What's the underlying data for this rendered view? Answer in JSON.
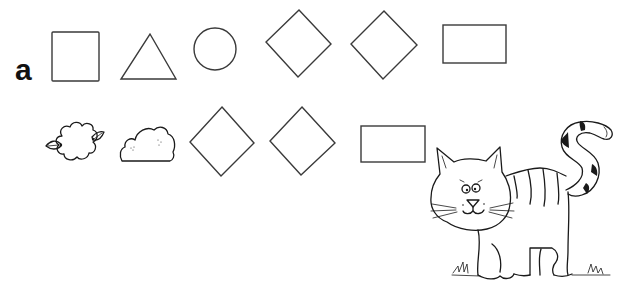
{
  "worksheet": {
    "exercise_label": "a",
    "row1": {
      "shapes": [
        {
          "type": "square",
          "name": "square"
        },
        {
          "type": "triangle",
          "name": "triangle"
        },
        {
          "type": "circle",
          "name": "circle"
        },
        {
          "type": "diamond",
          "name": "diamond"
        },
        {
          "type": "diamond",
          "name": "diamond"
        },
        {
          "type": "rectangle",
          "name": "rectangle"
        }
      ]
    },
    "row2": {
      "shapes": [
        {
          "type": "flower",
          "name": "flower"
        },
        {
          "type": "cloud",
          "name": "cloud"
        },
        {
          "type": "diamond",
          "name": "diamond"
        },
        {
          "type": "diamond",
          "name": "diamond"
        },
        {
          "type": "rectangle",
          "name": "rectangle"
        }
      ]
    },
    "illustration": {
      "subject": "cat",
      "style": "striped cartoon cat"
    },
    "colors": {
      "ink": "#1a1a1a",
      "outline": "#3a3a3a",
      "background": "#ffffff"
    }
  }
}
